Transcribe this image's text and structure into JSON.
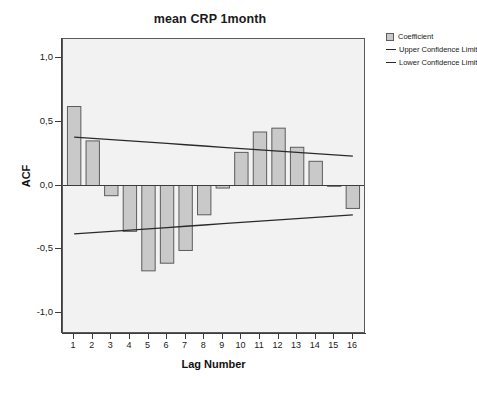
{
  "chart_data": {
    "type": "bar",
    "title": "mean CRP 1month",
    "xlabel": "Lag Number",
    "ylabel": "ACF",
    "categories": [
      "1",
      "2",
      "3",
      "4",
      "5",
      "6",
      "7",
      "8",
      "9",
      "10",
      "11",
      "12",
      "13",
      "14",
      "15",
      "16"
    ],
    "values": [
      0.62,
      0.35,
      -0.08,
      -0.36,
      -0.67,
      -0.61,
      -0.51,
      -0.23,
      -0.02,
      0.26,
      0.42,
      0.45,
      0.3,
      0.19,
      0.0,
      -0.18
    ],
    "series": [
      {
        "name": "Coefficient",
        "type": "bar",
        "values": [
          0.62,
          0.35,
          -0.08,
          -0.36,
          -0.67,
          -0.61,
          -0.51,
          -0.23,
          -0.02,
          0.26,
          0.42,
          0.45,
          0.3,
          0.19,
          0.0,
          -0.18
        ]
      },
      {
        "name": "Upper Confidence Limit",
        "type": "line",
        "values": [
          0.38,
          0.37,
          0.36,
          0.35,
          0.34,
          0.33,
          0.32,
          0.31,
          0.3,
          0.29,
          0.28,
          0.27,
          0.26,
          0.25,
          0.24,
          0.23
        ]
      },
      {
        "name": "Lower Confidence Limit",
        "type": "line",
        "values": [
          -0.38,
          -0.37,
          -0.36,
          -0.35,
          -0.34,
          -0.33,
          -0.32,
          -0.31,
          -0.3,
          -0.29,
          -0.28,
          -0.27,
          -0.26,
          -0.25,
          -0.24,
          -0.23
        ]
      }
    ],
    "ylim": [
      -1.15,
      1.15
    ],
    "xlim": [
      0.4,
      16.6
    ],
    "yticks": [
      1.0,
      0.5,
      0.0,
      -0.5,
      -1.0
    ],
    "ytick_labels": [
      "1,0",
      "0,5",
      "0,0",
      "-0,5",
      "-1,0"
    ],
    "xticks": [
      1,
      2,
      3,
      4,
      5,
      6,
      7,
      8,
      9,
      10,
      11,
      12,
      13,
      14,
      15,
      16
    ],
    "grid": false,
    "legend_position": "top-right",
    "bar_fill_color": "#c9c9c9",
    "bar_edge_color": "#5c5c5c",
    "line_color": "#2a2a2a",
    "plot_background": "#f2f2f2",
    "zero_line": 0.0
  },
  "legend": {
    "items": [
      {
        "label": "Coefficient",
        "swatch": "box"
      },
      {
        "label": "Upper Confidence Limit",
        "swatch": "line"
      },
      {
        "label": "Lower Confidence Limit",
        "swatch": "line"
      }
    ]
  }
}
